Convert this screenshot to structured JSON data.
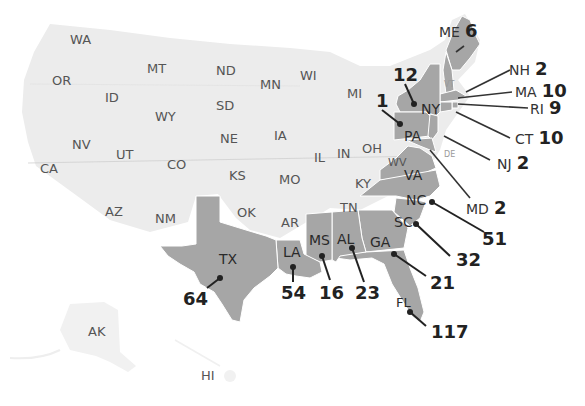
{
  "map": {
    "colors": {
      "base_fill": "#ececec",
      "highlight_fill": "#a6a6a6",
      "border": "#ffffff",
      "leader": "#222222",
      "label": "#555555"
    },
    "unhighlighted_labels": [
      {
        "abbr": "WA",
        "x": 70,
        "y": 40
      },
      {
        "abbr": "OR",
        "x": 52,
        "y": 74
      },
      {
        "abbr": "MT",
        "x": 147,
        "y": 61
      },
      {
        "abbr": "ID",
        "x": 105,
        "y": 90
      },
      {
        "abbr": "WY",
        "x": 155,
        "y": 108
      },
      {
        "abbr": "ND",
        "x": 216,
        "y": 63
      },
      {
        "abbr": "SD",
        "x": 216,
        "y": 98
      },
      {
        "abbr": "MN",
        "x": 260,
        "y": 77
      },
      {
        "abbr": "WI",
        "x": 300,
        "y": 68
      },
      {
        "abbr": "NE",
        "x": 220,
        "y": 131
      },
      {
        "abbr": "IA",
        "x": 274,
        "y": 128
      },
      {
        "abbr": "NV",
        "x": 72,
        "y": 137
      },
      {
        "abbr": "UT",
        "x": 116,
        "y": 147
      },
      {
        "abbr": "CA",
        "x": 40,
        "y": 160
      },
      {
        "abbr": "CO",
        "x": 167,
        "y": 157
      },
      {
        "abbr": "KS",
        "x": 229,
        "y": 168
      },
      {
        "abbr": "MO",
        "x": 279,
        "y": 172
      },
      {
        "abbr": "IL",
        "x": 314,
        "y": 150
      },
      {
        "abbr": "IN",
        "x": 337,
        "y": 146
      },
      {
        "abbr": "MI",
        "x": 347,
        "y": 86
      },
      {
        "abbr": "OH",
        "x": 362,
        "y": 147
      },
      {
        "abbr": "KY",
        "x": 355,
        "y": 176
      },
      {
        "abbr": "TN",
        "x": 340,
        "y": 201
      },
      {
        "abbr": "AZ",
        "x": 105,
        "y": 204
      },
      {
        "abbr": "NM",
        "x": 155,
        "y": 211
      },
      {
        "abbr": "OK",
        "x": 237,
        "y": 205
      },
      {
        "abbr": "AR",
        "x": 281,
        "y": 215
      },
      {
        "abbr": "WV",
        "x": 389,
        "y": 158
      },
      {
        "abbr": "AK",
        "x": 88,
        "y": 324
      },
      {
        "abbr": "HI",
        "x": 201,
        "y": 370
      }
    ],
    "tiny_labels": [
      {
        "abbr": "VT",
        "x": 444,
        "y": 82
      },
      {
        "abbr": "DE",
        "x": 443,
        "y": 152
      }
    ],
    "highlighted_states": [
      {
        "abbr": "ME",
        "value": 6
      },
      {
        "abbr": "NH",
        "value": 2
      },
      {
        "abbr": "MA",
        "value": 10
      },
      {
        "abbr": "RI",
        "value": 9
      },
      {
        "abbr": "CT",
        "value": 10
      },
      {
        "abbr": "NJ",
        "value": 2
      },
      {
        "abbr": "MD",
        "value": 2
      },
      {
        "abbr": "NY",
        "value": 12
      },
      {
        "abbr": "PA",
        "value": 1
      },
      {
        "abbr": "VA",
        "value": null
      },
      {
        "abbr": "NC",
        "value": 51
      },
      {
        "abbr": "SC",
        "value": 32
      },
      {
        "abbr": "GA",
        "value": 21
      },
      {
        "abbr": "FL",
        "value": 117
      },
      {
        "abbr": "AL",
        "value": 23
      },
      {
        "abbr": "MS",
        "value": 16
      },
      {
        "abbr": "LA",
        "value": 54
      },
      {
        "abbr": "TX",
        "value": 64
      }
    ],
    "callouts": {
      "ME": {
        "abbr": "ME",
        "value": "6"
      },
      "NH": {
        "abbr": "NH",
        "value": "2"
      },
      "MA": {
        "abbr": "MA",
        "value": "10"
      },
      "RI": {
        "abbr": "RI",
        "value": "9"
      },
      "CT": {
        "abbr": "CT",
        "value": "10"
      },
      "NJ": {
        "abbr": "NJ",
        "value": "2"
      },
      "MD": {
        "abbr": "MD",
        "value": "2"
      },
      "NY": {
        "abbr": "NY",
        "value": "12"
      },
      "PA": {
        "abbr": "PA",
        "value": "1"
      },
      "VA": {
        "abbr": "VA"
      },
      "NC": {
        "abbr": "NC",
        "value": "51"
      },
      "SC": {
        "abbr": "SC",
        "value": "32"
      },
      "GA": {
        "abbr": "GA",
        "value": "21"
      },
      "FL": {
        "abbr": "FL",
        "value": "117"
      },
      "AL": {
        "abbr": "AL",
        "value": "23"
      },
      "MS": {
        "abbr": "MS",
        "value": "16"
      },
      "LA": {
        "abbr": "LA",
        "value": "54"
      },
      "TX": {
        "abbr": "TX",
        "value": "64"
      }
    }
  }
}
